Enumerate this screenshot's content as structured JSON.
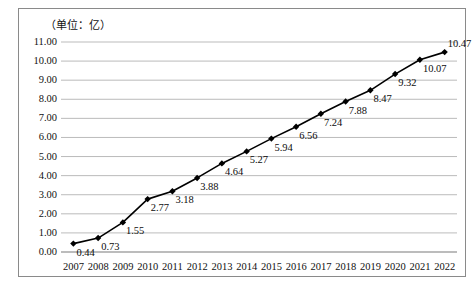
{
  "figure": {
    "unit_label": "（单位：亿）",
    "border_color": "#8a8a8a",
    "background": "#ffffff"
  },
  "chart_data": {
    "type": "line",
    "title": "",
    "subtitle": "",
    "xlabel": "",
    "ylabel": "",
    "unit_note": "（单位：亿）",
    "categories": [
      "2007",
      "2008",
      "2009",
      "2010",
      "2011",
      "2012",
      "2013",
      "2014",
      "2015",
      "2016",
      "2017",
      "2018",
      "2019",
      "2020",
      "2021",
      "2022"
    ],
    "values": [
      0.44,
      0.73,
      1.55,
      2.77,
      3.18,
      3.88,
      4.64,
      5.27,
      5.94,
      6.56,
      7.24,
      7.88,
      8.47,
      9.32,
      10.07,
      10.47
    ],
    "data_labels": [
      "0.44",
      "0.73",
      "1.55",
      "2.77",
      "3.18",
      "3.88",
      "4.64",
      "5.27",
      "5.94",
      "6.56",
      "7.24",
      "7.88",
      "8.47",
      "9.32",
      "10.07",
      "10.47"
    ],
    "ylim": [
      0,
      11
    ],
    "ytick_step": 1,
    "ytick_labels": [
      "11.00",
      "10.00",
      "9.00",
      "8.00",
      "7.00",
      "6.00",
      "5.00",
      "4.00",
      "3.00",
      "2.00",
      "1.00",
      "0.00"
    ],
    "ytick_values": [
      11,
      10,
      9,
      8,
      7,
      6,
      5,
      4,
      3,
      2,
      1,
      0
    ],
    "grid": "horizontal",
    "grid_color": "#b3b3b3",
    "legend": "none",
    "series_color": "#000000",
    "marker": "diamond",
    "marker_color": "#000000",
    "line_width": 1.6,
    "axis_line_color": "#7a7a7a"
  }
}
